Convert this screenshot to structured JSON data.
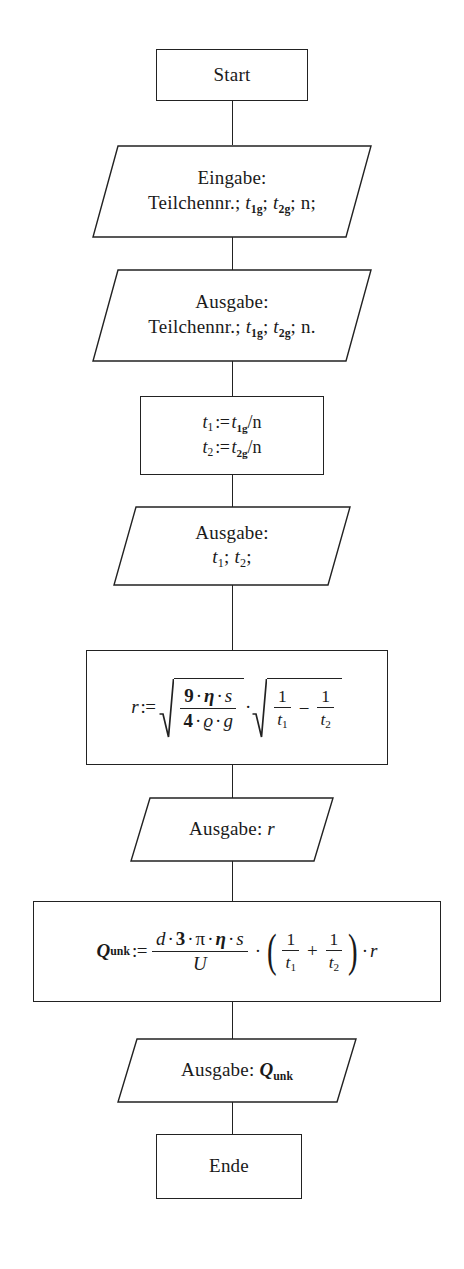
{
  "diagram": {
    "kind": "flowchart",
    "language": "de",
    "nodes": [
      {
        "id": "start",
        "shape": "rectangle",
        "role": "terminal",
        "label": "Start"
      },
      {
        "id": "eingabe-werte",
        "shape": "parallelogram",
        "role": "input",
        "line1": "Eingabe:",
        "line2_prefix": "Teilchennr.; ",
        "var1": "t",
        "var1_sub": "1g",
        "sep1": "; ",
        "var2": "t",
        "var2_sub": "2g",
        "sep2": "; ",
        "tail": "n;"
      },
      {
        "id": "ausgabe-werte",
        "shape": "parallelogram",
        "role": "output",
        "line1": "Ausgabe:",
        "line2_prefix": "Teilchennr.; ",
        "var1": "t",
        "var1_sub": "1g",
        "sep1": "; ",
        "var2": "t",
        "var2_sub": "2g",
        "sep2": "; ",
        "tail": "n."
      },
      {
        "id": "berechne-t1-t2",
        "shape": "rectangle",
        "role": "process",
        "line1": {
          "lhs": "t",
          "lhs_sub": "1",
          "op": ":=",
          "rhs": "t",
          "rhs_sub": "1g",
          "rhs_tail": "/n"
        },
        "line2": {
          "lhs": "t",
          "lhs_sub": "2",
          "op": ":=",
          "rhs": "t",
          "rhs_sub": "2g",
          "rhs_tail": "/n"
        }
      },
      {
        "id": "ausgabe-t1-t2",
        "shape": "parallelogram",
        "role": "output",
        "line1": "Ausgabe:",
        "var1": "t",
        "var1_sub": "1",
        "sep1": "; ",
        "var2": "t",
        "var2_sub": "2",
        "tail": ";"
      },
      {
        "id": "berechne-r",
        "shape": "rectangle",
        "role": "process",
        "formula_plain": "r := sqrt(9·η·s / 4·ϱ·g) · sqrt(1/t₁ − 1/t₂)",
        "lhs": "r",
        "op": ":=",
        "sqrt1_num": {
          "a": "9",
          "d1": "·",
          "b": "η",
          "d2": "·",
          "c": "s"
        },
        "sqrt1_den": {
          "a": "4",
          "d1": "·",
          "b": "ϱ",
          "d2": "·",
          "c": "g"
        },
        "mid_dot": "·",
        "sqrt2": {
          "left_num": "1",
          "left_den": "t",
          "left_den_sub": "1",
          "operator": "−",
          "right_num": "1",
          "right_den": "t",
          "right_den_sub": "2"
        }
      },
      {
        "id": "ausgabe-r",
        "shape": "parallelogram",
        "role": "output",
        "label": "Ausgabe: ",
        "var": "r"
      },
      {
        "id": "berechne-q",
        "shape": "rectangle",
        "role": "process",
        "formula_plain": "Q_unk := (d·3·π·η·s)/U · (1/t₁ + 1/t₂) · r",
        "lhs": "Q",
        "lhs_sub": "unk",
        "op": ":=",
        "frac_num": {
          "a": "d",
          "d1": "·",
          "b": "3",
          "d2": "·",
          "c": "π",
          "d3": "·",
          "d": "η",
          "d4": "·",
          "e": "s"
        },
        "frac_den": "U",
        "dot1": "·",
        "paren_open": "(",
        "left_num": "1",
        "left_den": "t",
        "left_den_sub": "1",
        "operator": "+",
        "right_num": "1",
        "right_den": "t",
        "right_den_sub": "2",
        "paren_close": ")",
        "dot2": "·",
        "tail": "r"
      },
      {
        "id": "ausgabe-q",
        "shape": "parallelogram",
        "role": "output",
        "label": "Ausgabe: ",
        "var": "Q",
        "var_sub": "unk"
      },
      {
        "id": "ende",
        "shape": "rectangle",
        "role": "terminal",
        "label": "Ende"
      }
    ],
    "colors": {
      "stroke": "#222222",
      "background": "#ffffff",
      "text": "#1a1a1a"
    }
  }
}
